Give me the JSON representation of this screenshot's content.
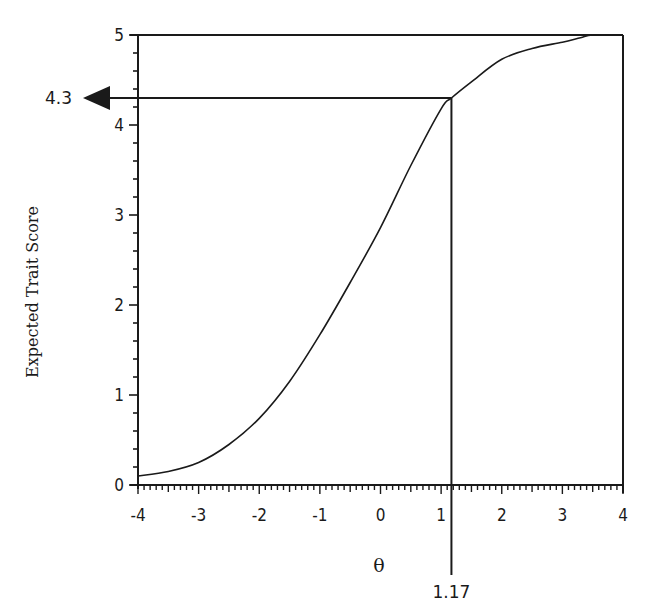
{
  "chart_data": {
    "type": "line",
    "title": "",
    "xlabel": "θ",
    "ylabel": "Expected Trait Score",
    "xlim": [
      -4,
      4
    ],
    "ylim": [
      0,
      5
    ],
    "grid": false,
    "legend": null,
    "x_ticks": [
      -4,
      -3,
      -2,
      -1,
      0,
      1,
      2,
      3,
      4
    ],
    "y_ticks": [
      0,
      1,
      2,
      3,
      4,
      5
    ],
    "x_minor_per_major": 10,
    "y_minor_per_major": 5,
    "series": [
      {
        "name": "Test characteristic curve",
        "x": [
          -4,
          -3.5,
          -3,
          -2.5,
          -2,
          -1.5,
          -1,
          -0.5,
          0,
          0.5,
          1,
          1.17,
          1.5,
          2,
          2.5,
          3,
          3.3,
          3.5,
          4
        ],
        "y": [
          0.1,
          0.15,
          0.25,
          0.45,
          0.74,
          1.15,
          1.67,
          2.25,
          2.86,
          3.55,
          4.18,
          4.3,
          4.48,
          4.73,
          4.85,
          4.92,
          4.97,
          5.0,
          5.0
        ]
      }
    ],
    "annotations": [
      {
        "type": "arrow-to-y-axis",
        "y": 4.3,
        "label": "4.3",
        "from_x": 1.17
      },
      {
        "type": "vertical-line-to-x-axis",
        "x": 1.17,
        "label": "1.17",
        "from_y": 4.3,
        "extends_below_axis": true
      }
    ],
    "frame": {
      "top_line_at_y": 5,
      "right_line_at_x": 4
    }
  }
}
